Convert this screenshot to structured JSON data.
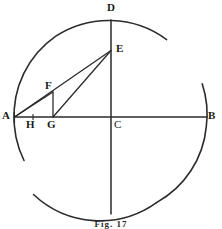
{
  "figure": {
    "caption": "Fig. 17",
    "ink_color": "#2b2b2b",
    "background_color": "#ffffff",
    "labels": [
      {
        "id": "D",
        "text": "D",
        "x": 107,
        "y": 2
      },
      {
        "id": "E",
        "text": "E",
        "x": 116,
        "y": 43
      },
      {
        "id": "F",
        "text": "F",
        "x": 45,
        "y": 80
      },
      {
        "id": "A",
        "text": "A",
        "x": 2,
        "y": 110
      },
      {
        "id": "H",
        "text": "H",
        "x": 26,
        "y": 119
      },
      {
        "id": "G",
        "text": "G",
        "x": 47,
        "y": 119
      },
      {
        "id": "C",
        "text": "C",
        "x": 114,
        "y": 119
      },
      {
        "id": "B",
        "text": "B",
        "x": 208,
        "y": 110
      }
    ],
    "points": {
      "A": {
        "x": 14,
        "y": 117
      },
      "B": {
        "x": 207,
        "y": 117
      },
      "C": {
        "x": 111,
        "y": 117
      },
      "D": {
        "x": 111,
        "y": 20
      },
      "E": {
        "x": 111,
        "y": 50
      },
      "F": {
        "x": 53,
        "y": 92
      },
      "G": {
        "x": 53,
        "y": 117
      },
      "H": {
        "x": 33,
        "y": 117
      }
    },
    "circle": {
      "cx": 111,
      "cy": 117,
      "r": 97,
      "arcs": [
        {
          "name": "arc-upper-left-to-top",
          "start_deg": 183,
          "end_deg": 305
        },
        {
          "name": "arc-right",
          "start_deg": 340,
          "end_deg": 62
        },
        {
          "name": "arc-bottom",
          "start_deg": 62,
          "end_deg": 143
        }
      ]
    },
    "segments": [
      {
        "name": "horizontal-diameter-AB",
        "from": "A",
        "to": "B"
      },
      {
        "name": "vertical-diameter-D-bottom",
        "x": 111,
        "y1": 20,
        "y2": 214
      },
      {
        "name": "chord-A-to-E",
        "from": "A",
        "to": "E"
      },
      {
        "name": "chord-A-to-F",
        "from": "A",
        "to": "F"
      },
      {
        "name": "chord-G-to-E",
        "from": "G",
        "to": "E"
      },
      {
        "name": "perpendicular-F-to-G",
        "from": "F",
        "to": "G"
      }
    ]
  }
}
